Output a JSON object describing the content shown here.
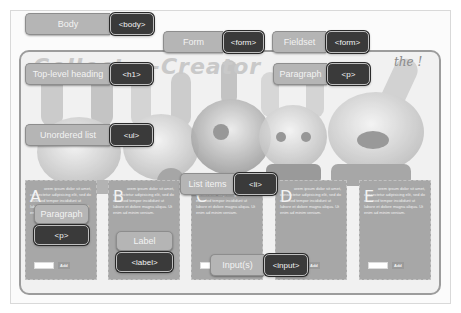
{
  "diagram": {
    "annotations": [
      {
        "id": "body",
        "label": "Body",
        "tag": "<body>"
      },
      {
        "id": "form",
        "label": "Form",
        "tag": "<form>"
      },
      {
        "id": "fieldset",
        "label": "Fieldset",
        "tag": "<form>"
      },
      {
        "id": "h1",
        "label": "Top-level heading",
        "tag": "<h1>"
      },
      {
        "id": "p-top",
        "label": "Paragraph",
        "tag": "<p>"
      },
      {
        "id": "ul",
        "label": "Unordered list",
        "tag": "<ul>"
      },
      {
        "id": "li",
        "label": "List items",
        "tag": "<li>"
      },
      {
        "id": "p-card",
        "label": "Paragraph",
        "tag": "<p>"
      },
      {
        "id": "label",
        "label": "Label",
        "tag": "<label>"
      },
      {
        "id": "input",
        "label": "Input(s)",
        "tag": "<input>"
      }
    ]
  },
  "background": {
    "logo_text": "Collect-a-Creator",
    "note_text": "the !"
  },
  "cards": [
    {
      "letter": "A",
      "text": "orem ipsum dolor sit amet, consectetur adipisicing elit, sed do eiusmod tempor incididunt ut labore et dolore magna aliqua. Ut enim ad minim veniam.",
      "button": "Add"
    },
    {
      "letter": "B",
      "text": "orem ipsum dolor sit amet, consectetur adipisicing elit, sed do eiusmod tempor incididunt ut labore et dolore magna aliqua. Ut enim ad minim veniam.",
      "button": "Add"
    },
    {
      "letter": "C",
      "text": "orem ipsum dolor sit amet, consectetur adipisicing elit, sed do eiusmod tempor incididunt ut labore et dolore magna aliqua. Ut enim ad minim veniam.",
      "button": "Add"
    },
    {
      "letter": "D",
      "text": "orem ipsum dolor sit amet, consectetur adipisicing elit, sed do eiusmod tempor incididunt ut labore et dolore magna aliqua. Ut enim ad minim veniam.",
      "button": "Add"
    },
    {
      "letter": "E",
      "text": "orem ipsum dolor sit amet, consectetur adipisicing elit, sed do eiusmod tempor incididunt ut labore et dolore magna aliqua. Ut enim ad minim veniam.",
      "button": "Add"
    }
  ]
}
